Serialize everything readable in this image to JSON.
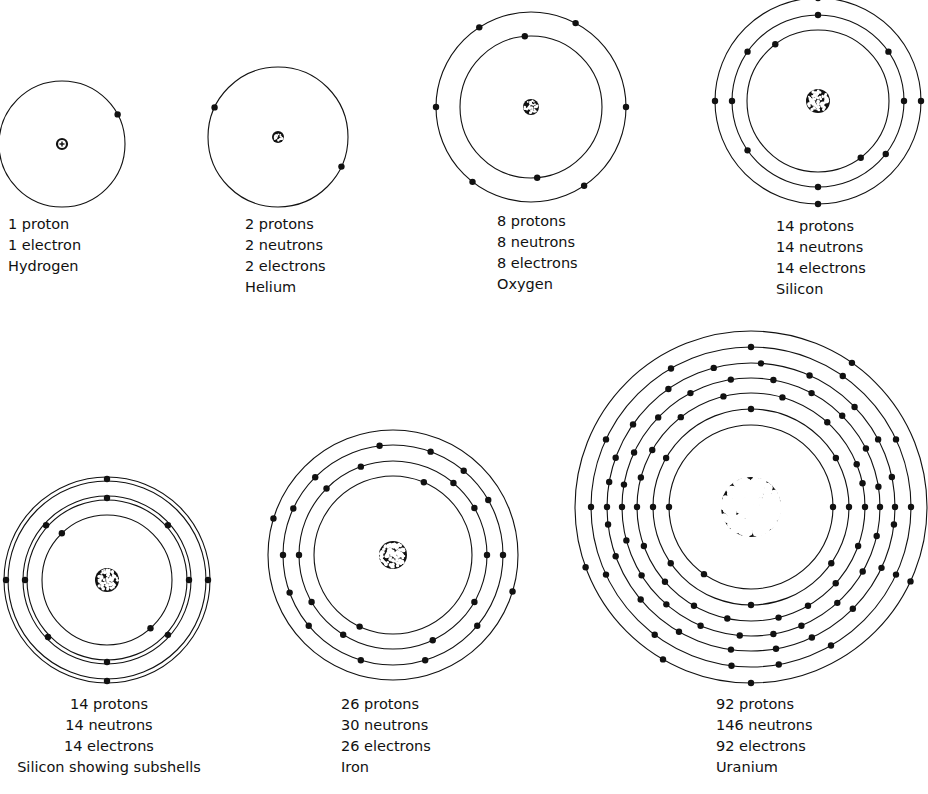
{
  "colors": {
    "ink": "#111111",
    "paper": "#ffffff",
    "nucleus_dot": "#ffffff"
  },
  "atoms": [
    {
      "id": "hydrogen",
      "cx": 62,
      "cy": 144,
      "nucleus_r": 5,
      "nucleus_style": "plus",
      "shells": [
        {
          "r": 63,
          "double": false,
          "electrons_deg": [
            -28
          ]
        }
      ],
      "label": {
        "x": 8,
        "y": 214,
        "align": "left",
        "lines": [
          "1 proton",
          "1 electron",
          "Hydrogen"
        ]
      }
    },
    {
      "id": "helium",
      "cx": 278,
      "cy": 137,
      "nucleus_r": 6,
      "nucleus_style": "cluster",
      "shells": [
        {
          "r": 70,
          "double": false,
          "electrons_deg": [
            205,
            25
          ]
        }
      ],
      "label": {
        "x": 245,
        "y": 214,
        "align": "left",
        "lines": [
          "2 protons",
          "2 neutrons",
          "2 electrons",
          "Helium"
        ]
      }
    },
    {
      "id": "oxygen",
      "cx": 531,
      "cy": 107,
      "nucleus_r": 8,
      "nucleus_style": "cluster",
      "shells": [
        {
          "r": 71,
          "double": false,
          "electrons_deg": [
            -95,
            85
          ]
        },
        {
          "r": 95,
          "double": false,
          "electrons_deg": [
            -62,
            -123,
            180,
            0,
            128,
            56
          ]
        }
      ],
      "label": {
        "x": 497,
        "y": 211,
        "align": "left",
        "lines": [
          "8 protons",
          "8 neutrons",
          "8 electrons",
          "Oxygen"
        ]
      }
    },
    {
      "id": "silicon",
      "cx": 818,
      "cy": 101,
      "nucleus_r": 12,
      "nucleus_style": "cluster",
      "shells": [
        {
          "r": 71,
          "double": false,
          "electrons_deg": [
            -127,
            53
          ]
        },
        {
          "r": 86,
          "double": false,
          "electrons_deg": [
            -90,
            -35,
            -145,
            180,
            0,
            145,
            38,
            90
          ]
        },
        {
          "r": 103,
          "double": false,
          "electrons_deg": [
            180,
            0,
            90,
            -90
          ]
        }
      ],
      "label": {
        "x": 776,
        "y": 216,
        "align": "left",
        "lines": [
          "14 protons",
          "14 neutrons",
          "14 electrons",
          "Silicon"
        ]
      }
    },
    {
      "id": "silicon-subshells",
      "cx": 107,
      "cy": 580,
      "nucleus_r": 12,
      "nucleus_style": "cluster",
      "shells": [
        {
          "r": 65,
          "double": false,
          "electrons_deg": [
            -134,
            48
          ]
        },
        {
          "r": 80,
          "double": true,
          "electrons_deg": [
            -90,
            -42,
            -138,
            180,
            0,
            136,
            42,
            90
          ]
        },
        {
          "r": 99,
          "double": true,
          "electrons_deg": [
            -90,
            180,
            0,
            90
          ]
        }
      ],
      "label": {
        "x": 14,
        "y": 694,
        "align": "center",
        "width": 190,
        "lines": [
          "14 protons",
          "14 neutrons",
          "14 electrons",
          "Silicon showing subshells"
        ]
      }
    },
    {
      "id": "iron",
      "cx": 393,
      "cy": 555,
      "nucleus_r": 14,
      "nucleus_style": "cluster",
      "shells": [
        {
          "r": 79,
          "double": false,
          "electrons_deg": [
            -67,
            115
          ]
        },
        {
          "r": 94,
          "double": false,
          "electrons_deg": [
            -110,
            -50,
            180,
            0,
            150,
            30,
            65,
            122,
            -135,
            -30
          ]
        },
        {
          "r": 110,
          "double": false,
          "electrons_deg": [
            -97,
            -70,
            -135,
            -50,
            -155,
            -30,
            180,
            0,
            160,
            40,
            140,
            107,
            73
          ]
        },
        {
          "r": 125,
          "double": false,
          "electrons_deg": [
            -163,
            17
          ]
        }
      ],
      "label": {
        "x": 341,
        "y": 694,
        "align": "left",
        "lines": [
          "26 protons",
          "30 neutrons",
          "26 electrons",
          "Iron"
        ]
      }
    },
    {
      "id": "uranium",
      "cx": 751,
      "cy": 507,
      "nucleus_r": 30,
      "nucleus_style": "cluster",
      "shells": [
        {
          "r": 82,
          "double": false,
          "electrons_deg": [
            180,
            0,
            125
          ]
        },
        {
          "r": 98,
          "double": false,
          "electrons_deg": [
            -90,
            -30,
            -150,
            180,
            0,
            35,
            145,
            90
          ]
        },
        {
          "r": 114,
          "double": false,
          "electrons_deg": [
            -104,
            -74,
            -48,
            -128,
            -150,
            -22,
            180,
            0,
            160,
            20,
            139,
            42,
            120,
            60,
            102,
            76,
            -165,
            -12
          ]
        },
        {
          "r": 129,
          "double": false,
          "electrons_deg": [
            -99,
            -80,
            -62,
            -118,
            -136,
            -45,
            -155,
            -27,
            180,
            0,
            165,
            13,
            148,
            30,
            131,
            48,
            113,
            67,
            95,
            -170,
            -9,
            80
          ]
        },
        {
          "r": 144,
          "double": false,
          "electrons_deg": [
            -105,
            -86,
            -125,
            -66,
            -145,
            -44,
            -160,
            -28,
            180,
            0,
            160,
            25,
            140,
            45,
            120,
            65,
            98,
            80,
            -170,
            -12,
            173,
            7
          ]
        },
        {
          "r": 160,
          "double": false,
          "electrons_deg": [
            -90,
            -120,
            -55,
            -155,
            -25,
            180,
            0,
            155,
            25,
            127,
            60,
            97,
            80
          ]
        },
        {
          "r": 176,
          "double": false,
          "electrons_deg": [
            -55,
            160,
            25,
            120,
            90
          ]
        }
      ],
      "label": {
        "x": 716,
        "y": 694,
        "align": "left",
        "lines": [
          "92 protons",
          "146 neutrons",
          "92 electrons",
          "Uranium"
        ]
      }
    }
  ]
}
